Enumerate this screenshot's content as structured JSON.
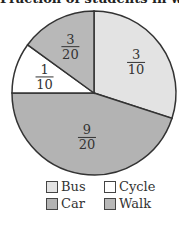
{
  "chart_data": {
    "type": "pie",
    "title": "Fraction of students in walk",
    "categories": [
      "Bus",
      "Car",
      "Cycle",
      "Walk"
    ],
    "values": [
      0.3,
      0.45,
      0.1,
      0.15
    ],
    "labels": [
      "3/10",
      "9/20",
      "1/10",
      "3/20"
    ],
    "colors": [
      "#e3e3e3",
      "#b3b3b3",
      "#ffffff",
      "#b8b8b8"
    ],
    "start_angle_deg": 0,
    "direction": "clockwise",
    "legend_position": "bottom"
  },
  "title": "Fraction of students in walk",
  "slices": [
    {
      "name": "Bus",
      "num": "3",
      "den": "10"
    },
    {
      "name": "Car",
      "num": "9",
      "den": "20"
    },
    {
      "name": "Cycle",
      "num": "1",
      "den": "10"
    },
    {
      "name": "Walk",
      "num": "3",
      "den": "20"
    }
  ],
  "legend": [
    {
      "label": "Bus",
      "color": "#e3e3e3"
    },
    {
      "label": "Cycle",
      "color": "#ffffff"
    },
    {
      "label": "Car",
      "color": "#b3b3b3"
    },
    {
      "label": "Walk",
      "color": "#b8b8b8"
    }
  ]
}
